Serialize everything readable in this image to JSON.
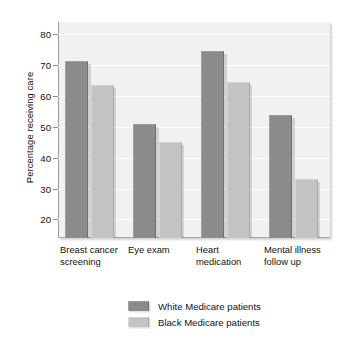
{
  "chart_data": {
    "type": "bar",
    "title": "",
    "subtitle": "",
    "xlabel": "",
    "ylabel": "Percentage receiving care",
    "ylim": [
      14,
      84
    ],
    "yticks": [
      20,
      30,
      40,
      50,
      60,
      70,
      80
    ],
    "ytick_labels": [
      "20",
      "30",
      "40",
      "50",
      "60",
      "70",
      "80"
    ],
    "grid": "horizontal",
    "legend_position": "bottom-center",
    "categories": [
      "Breast cancer\nscreening",
      "Eye exam",
      "Heart\nmedication",
      "Mental illness\nfollow up"
    ],
    "series": [
      {
        "name": "White Medicare patients",
        "color": "#8b8b8b",
        "values": [
          71.5,
          51,
          74.5,
          54
        ]
      },
      {
        "name": "Black Medicare patients",
        "color": "#c3c3c3",
        "values": [
          63.5,
          45,
          64.5,
          33
        ]
      }
    ]
  },
  "colors": {
    "plot_background": "#f1f1f1",
    "gridline": "#ffffff",
    "axis": "#9b9b9b",
    "text": "#111111",
    "series_white": "#8b8b8b",
    "series_black": "#c3c3c3"
  }
}
